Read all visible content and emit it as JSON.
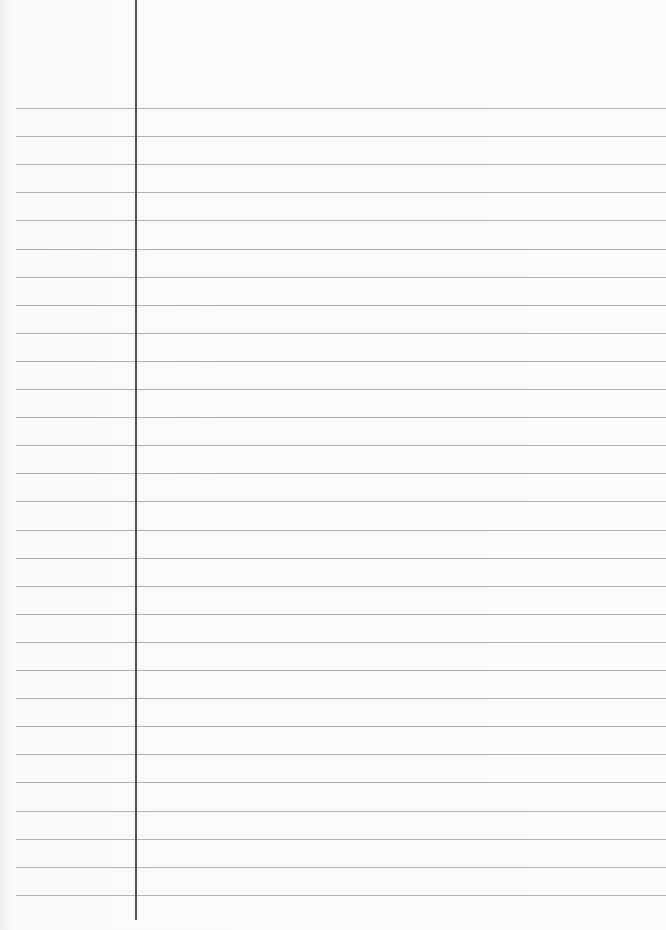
{
  "document": {
    "type": "blank lined paper",
    "rule_count": 29,
    "first_rule_y": 108,
    "rule_spacing": 28.1,
    "margin_x": 135,
    "rule_color": "#9a9a9a",
    "margin_color": "#555555"
  }
}
